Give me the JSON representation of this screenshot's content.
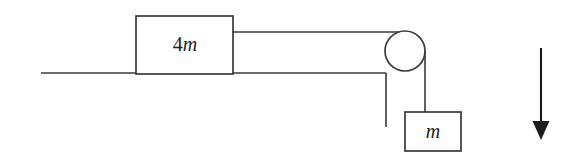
{
  "diagram": {
    "type": "physics-free-body-pulley-system",
    "background_color": "#ffffff",
    "line_color": "#3a3a3a",
    "arrow_color": "#1c1c1c",
    "blocks": [
      {
        "id": "block-on-surface",
        "label_number": "4",
        "label_symbol": "m",
        "label_full": "4m",
        "x": 136,
        "y": 16,
        "width": 97,
        "height": 58
      },
      {
        "id": "hanging-block",
        "label_number": "",
        "label_symbol": "m",
        "label_full": "m",
        "x": 405,
        "y": 112,
        "width": 56,
        "height": 39
      }
    ],
    "pulley": {
      "id": "pulley-wheel",
      "center_x": 405,
      "center_y": 51,
      "radius": 20
    },
    "surface": {
      "id": "ground-surface",
      "start_x": 41,
      "end_x": 386,
      "y": 73
    },
    "support": {
      "id": "vertical-support-post",
      "x": 386,
      "top_y": 73,
      "bottom_y": 127
    },
    "strings": [
      {
        "id": "horizontal-string",
        "from_x": 233,
        "from_y": 32,
        "to_x": 405,
        "to_y": 32
      },
      {
        "id": "vertical-string",
        "from_x": 425,
        "from_y": 51,
        "to_x": 425,
        "to_y": 112
      }
    ],
    "arrow": {
      "id": "gravity-direction-arrow",
      "direction": "down",
      "x": 541,
      "top_y": 48,
      "bottom_y": 140,
      "head_width": 17,
      "head_height": 19
    }
  }
}
